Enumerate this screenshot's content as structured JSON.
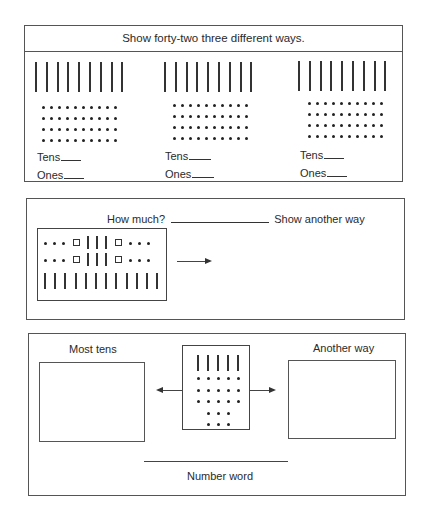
{
  "panel1": {
    "title": "Show forty-two three different ways.",
    "groups": [
      {
        "tens_label": "Tens",
        "ones_label": "Ones",
        "sticks": 9,
        "dot_rows": 4,
        "dots_per_row": 10
      },
      {
        "tens_label": "Tens",
        "ones_label": "Ones",
        "sticks": 9,
        "dot_rows": 4,
        "dots_per_row": 10
      },
      {
        "tens_label": "Tens",
        "ones_label": "Ones",
        "sticks": 9,
        "dot_rows": 4,
        "dots_per_row": 10
      }
    ]
  },
  "panel2": {
    "question": "How much?",
    "prompt": "Show another way",
    "model": {
      "top_rows": [
        "dot",
        "dot",
        "dot",
        "square",
        "stick",
        "stick",
        "stick",
        "square",
        "dot",
        "dot",
        "dot"
      ],
      "row_count": 2,
      "bottom_sticks": 12
    }
  },
  "panel3": {
    "left_label": "Most tens",
    "right_label": "Another way",
    "footer_label": "Number word",
    "model": {
      "sticks": 5,
      "dot_rows": [
        5,
        5,
        5,
        3,
        3
      ]
    }
  }
}
